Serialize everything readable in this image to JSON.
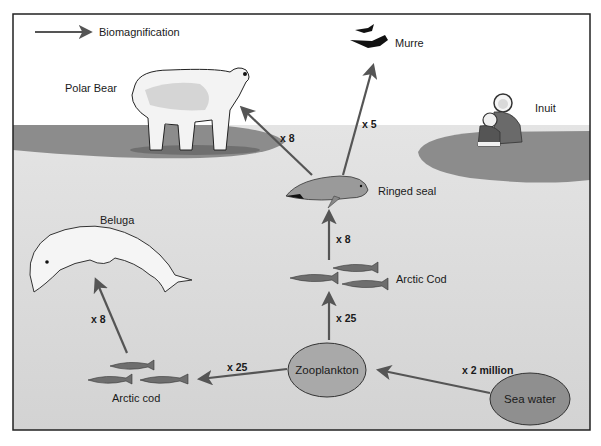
{
  "legend": {
    "label": "Biomagnification",
    "icon": "arrow-right-icon"
  },
  "colors": {
    "sky": "#ffffff",
    "water": "#d9d9d9",
    "ice": "#8c8c8c",
    "arrow": "#555555",
    "node_fill": "#a9a9a9",
    "frame": "#222222"
  },
  "organisms": {
    "polar_bear": "Polar Bear",
    "murre": "Murre",
    "inuit": "Inuit",
    "ringed_seal": "Ringed seal",
    "arctic_cod_upper": "Arctic Cod",
    "beluga": "Beluga",
    "arctic_cod_lower": "Arctic cod"
  },
  "nodes": {
    "zooplankton": "Zooplankton",
    "sea_water": "Sea water"
  },
  "arrows": {
    "seal_to_bear": "x 8",
    "seal_to_murre": "x 5",
    "cod_to_seal": "x 8",
    "zoo_to_cod_upper": "x 25",
    "cod_lower_to_beluga": "x 8",
    "zoo_to_cod_lower": "x 25",
    "water_to_zoo": "x 2 million"
  }
}
